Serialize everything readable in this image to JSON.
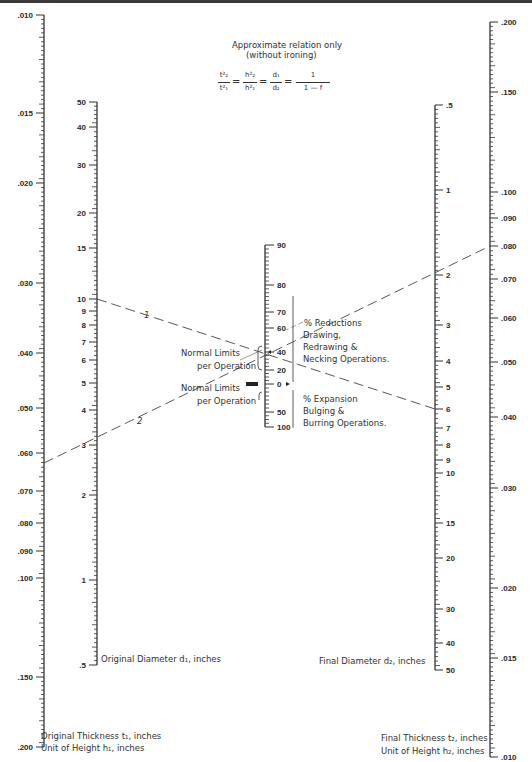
{
  "header": {
    "note_line1": "Approximate relation only",
    "note_line2": "(without ironing)",
    "formula": {
      "t2_over_t1": [
        "t²₂",
        "t²₁"
      ],
      "h2_over_h1": [
        "h²₂",
        "h²₁"
      ],
      "d1_over_d2": [
        "d₁",
        "d₂"
      ],
      "one_over": [
        "1",
        "1 — f"
      ]
    }
  },
  "axes": {
    "original_thickness": {
      "title_line1": "Original Thickness t₁, inches",
      "title_line2": "Unit of Height h₁, inches",
      "x": 44,
      "ticks": [
        {
          "label": ".010",
          "y": 15
        },
        {
          "label": ".015",
          "y": 113
        },
        {
          "label": ".020",
          "y": 183
        },
        {
          "label": ".030",
          "y": 283
        },
        {
          "label": ".040",
          "y": 353
        },
        {
          "label": ".050",
          "y": 408
        },
        {
          "label": ".060",
          "y": 453
        },
        {
          "label": ".070",
          "y": 491
        },
        {
          "label": ".080",
          "y": 523
        },
        {
          "label": ".090",
          "y": 551
        },
        {
          "label": ".100",
          "y": 578
        },
        {
          "label": ".150",
          "y": 677
        },
        {
          "label": ".200",
          "y": 747
        }
      ]
    },
    "original_diameter": {
      "title": "Original Diameter d₁, inches",
      "x": 97,
      "ticks": [
        {
          "label": "50",
          "y": 102
        },
        {
          "label": "40",
          "y": 127
        },
        {
          "label": "30",
          "y": 165
        },
        {
          "label": "20",
          "y": 213
        },
        {
          "label": "15",
          "y": 248
        },
        {
          "label": "10",
          "y": 299
        },
        {
          "label": "9",
          "y": 311
        },
        {
          "label": "8",
          "y": 325
        },
        {
          "label": "7",
          "y": 342
        },
        {
          "label": "6",
          "y": 360
        },
        {
          "label": "5",
          "y": 383
        },
        {
          "label": "4",
          "y": 410
        },
        {
          "label": "3",
          "y": 445
        },
        {
          "label": "2",
          "y": 495
        },
        {
          "label": "1",
          "y": 580
        },
        {
          "label": ".5",
          "y": 665
        }
      ]
    },
    "percent": {
      "x": 265,
      "ticks": [
        {
          "label": "90",
          "y": 245
        },
        {
          "label": "80",
          "y": 285
        },
        {
          "label": "70",
          "y": 312
        },
        {
          "label": "60",
          "y": 328
        },
        {
          "label": "40",
          "y": 352
        },
        {
          "label": "20",
          "y": 370
        },
        {
          "label": "0",
          "y": 384
        },
        {
          "label": "50",
          "y": 412
        },
        {
          "label": "100",
          "y": 427
        }
      ],
      "reductions_label": "% Reductions",
      "reductions_ops": [
        "Drawing,",
        "Redrawing &",
        "Necking Operations."
      ],
      "expansion_label": "% Expansion",
      "expansion_ops": [
        "Bulging &",
        "Burring Operations."
      ],
      "normal_limits_upper": [
        "Normal Limits",
        "per Operation"
      ],
      "normal_limits_lower": [
        "Normal Limits",
        "per Operation"
      ]
    },
    "final_diameter": {
      "title": "Final Diameter d₂, inches",
      "x": 435,
      "ticks": [
        {
          "label": ".5",
          "y": 105
        },
        {
          "label": "1",
          "y": 190
        },
        {
          "label": "2",
          "y": 275
        },
        {
          "label": "3",
          "y": 325
        },
        {
          "label": "4",
          "y": 361
        },
        {
          "label": "5",
          "y": 387
        },
        {
          "label": "6",
          "y": 409
        },
        {
          "label": "7",
          "y": 428
        },
        {
          "label": "8",
          "y": 445
        },
        {
          "label": "9",
          "y": 460
        },
        {
          "label": "10",
          "y": 473
        },
        {
          "label": "15",
          "y": 523
        },
        {
          "label": "20",
          "y": 558
        },
        {
          "label": "30",
          "y": 609
        },
        {
          "label": "40",
          "y": 643
        },
        {
          "label": "50",
          "y": 670
        }
      ]
    },
    "final_thickness": {
      "title_line1": "Final Thickness t₂, inches",
      "title_line2": "Unit of Height h₂, inches",
      "x": 490,
      "ticks": [
        {
          "label": ".200",
          "y": 22
        },
        {
          "label": ".150",
          "y": 92
        },
        {
          "label": ".100",
          "y": 192
        },
        {
          "label": ".090",
          "y": 218
        },
        {
          "label": ".080",
          "y": 246
        },
        {
          "label": ".070",
          "y": 279
        },
        {
          "label": ".060",
          "y": 318
        },
        {
          "label": ".050",
          "y": 362
        },
        {
          "label": ".040",
          "y": 417
        },
        {
          "label": ".030",
          "y": 488
        },
        {
          "label": ".020",
          "y": 588
        },
        {
          "label": ".015",
          "y": 658
        },
        {
          "label": ".010",
          "y": 757
        }
      ]
    }
  },
  "example_lines": [
    {
      "label": "1",
      "from": [
        97,
        299
      ],
      "to": [
        435,
        409
      ],
      "label_pos": [
        144,
        318
      ]
    },
    {
      "label": "2",
      "from": [
        44,
        463
      ],
      "to": [
        490,
        246
      ],
      "label_pos": [
        137,
        424
      ]
    }
  ]
}
